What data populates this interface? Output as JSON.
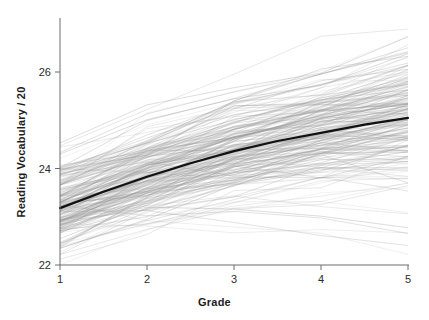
{
  "chart_data": {
    "type": "line",
    "title": "",
    "subtitle": "",
    "xlabel": "Grade",
    "ylabel": "Reading Vocabulary / 20",
    "xlim": [
      1,
      5
    ],
    "ylim": [
      21.7,
      27.1
    ],
    "xticks": [
      1,
      2,
      3,
      4,
      5
    ],
    "xtick_labels": [
      "1",
      "2",
      "3",
      "4",
      "5"
    ],
    "yticks": [
      22,
      24,
      26
    ],
    "ytick_labels": [
      "22",
      "24",
      "26"
    ],
    "grid": false,
    "legend": "none",
    "annotations": [],
    "series": [
      {
        "name": "Average trend",
        "role": "mean-fit",
        "color": "#111111",
        "linewidth": 2.2,
        "x": [
          1,
          1.5,
          2,
          2.5,
          3,
          3.5,
          4,
          4.5,
          5
        ],
        "values": [
          23.18,
          23.52,
          23.83,
          24.11,
          24.36,
          24.57,
          24.74,
          24.91,
          25.05
        ]
      },
      {
        "name": "Individual subjects",
        "role": "spaghetti",
        "color": "#9a9a9a",
        "linewidth": 0.55,
        "opacity": 0.45,
        "n_lines": 205,
        "x": [
          1,
          2,
          3,
          4,
          5
        ],
        "value_range_by_grade": [
          {
            "grade": 1,
            "min": 22.0,
            "q1": 22.6,
            "median": 23.2,
            "q3": 23.8,
            "max": 25.3
          },
          {
            "grade": 2,
            "min": 22.1,
            "q1": 23.3,
            "median": 23.9,
            "q3": 24.6,
            "max": 26.0
          },
          {
            "grade": 3,
            "min": 22.4,
            "q1": 23.8,
            "median": 24.4,
            "q3": 25.1,
            "max": 26.6
          },
          {
            "grade": 4,
            "min": 22.3,
            "q1": 24.1,
            "median": 24.8,
            "q3": 25.5,
            "max": 26.8
          },
          {
            "grade": 5,
            "min": 22.5,
            "q1": 24.3,
            "median": 25.1,
            "q3": 25.8,
            "max": 27.0
          }
        ]
      }
    ]
  },
  "axes": {
    "x_title": "Grade",
    "y_title": "Reading Vocabulary / 20"
  },
  "colors": {
    "trend": "#111111",
    "spaghetti": "#9a9a9a",
    "axis": "#6d6d6d",
    "text": "#1d1d1d",
    "background": "#ffffff"
  }
}
